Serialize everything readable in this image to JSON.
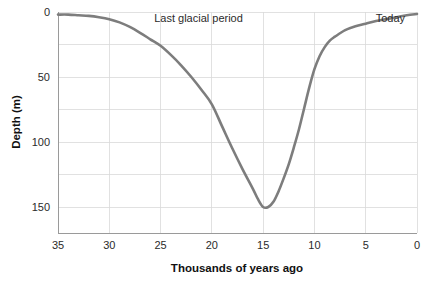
{
  "chart_data": {
    "type": "line",
    "title": "",
    "xlabel": "Thousands of years ago",
    "ylabel": "Depth (m)",
    "xlim": [
      35,
      0
    ],
    "ylim": [
      170,
      0
    ],
    "x_ticks": [
      35,
      30,
      25,
      20,
      15,
      10,
      5,
      0
    ],
    "x_tick_labels": [
      "35",
      "30",
      "25",
      "20",
      "15",
      "10",
      "5",
      "0"
    ],
    "y_ticks": [
      0,
      50,
      100,
      150
    ],
    "y_tick_labels": [
      "0",
      "50",
      "100",
      "150"
    ],
    "y_gridlines": [
      0,
      25,
      50,
      75,
      100,
      125,
      150
    ],
    "grid": true,
    "legend": false,
    "axis_inverted_x": true,
    "axis_inverted_y": true,
    "series": [
      {
        "name": "Sea level depth",
        "color": "#7d7d7d",
        "x": [
          35,
          34,
          33,
          32,
          31,
          30,
          29,
          28,
          27,
          26,
          25,
          24,
          23,
          22,
          21,
          20,
          19,
          18,
          17,
          16,
          15.5,
          15,
          14.5,
          14,
          13.5,
          13,
          12.5,
          12,
          11.5,
          11,
          10.5,
          10,
          9.5,
          9,
          8.5,
          8,
          7,
          6,
          5,
          4,
          3,
          2,
          1,
          0
        ],
        "y": [
          2,
          2,
          2.5,
          3,
          4,
          5.5,
          8,
          11.5,
          16,
          21,
          26,
          33,
          41,
          50,
          60,
          71,
          88,
          105,
          121,
          136,
          144,
          150,
          150,
          146,
          138,
          128,
          117,
          104,
          90,
          74,
          58,
          44,
          34,
          27,
          22,
          19,
          14,
          11,
          9,
          7,
          5.5,
          4,
          2.5,
          1.5
        ]
      }
    ],
    "annotations": [
      {
        "text": "Last glacial period",
        "x": 21.3,
        "y": 8
      },
      {
        "text": "Today",
        "x": 2.6,
        "y": 8
      }
    ],
    "colors": {
      "curve": "#7d7d7d",
      "grid": "#d9d9d9",
      "axis": "#9a9a9a",
      "text": "#2b2b2b",
      "background": "#ffffff"
    }
  }
}
